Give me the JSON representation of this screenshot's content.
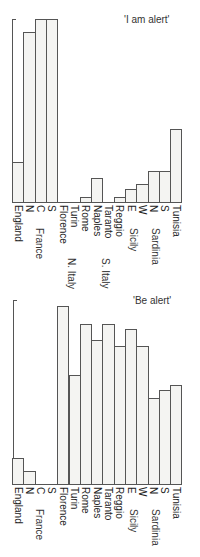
{
  "chart_data": [
    {
      "type": "bar",
      "title": "'I am alert'",
      "xlabel": "",
      "ylabel": "",
      "ylim": [
        0,
        100
      ],
      "grid": false,
      "orientation": "vertical bars, labels rotated 90°",
      "categories": [
        "England",
        "N",
        "C",
        "S",
        "Florence",
        "Turin",
        "Rome",
        "Naples",
        "Taranto",
        "Reggio",
        "E",
        "W",
        "N",
        "S",
        "Tunisia"
      ],
      "groups": [
        {
          "label": "France",
          "members": [
            "N",
            "C",
            "S"
          ]
        },
        {
          "label": "N. Italy",
          "members": [
            "Florence",
            "Turin",
            "Rome"
          ]
        },
        {
          "label": "S. Italy",
          "members": [
            "Naples",
            "Taranto",
            "Reggio"
          ]
        },
        {
          "label": "Sicily",
          "members": [
            "E",
            "W"
          ]
        },
        {
          "label": "Sardinia",
          "members": [
            "N",
            "S"
          ]
        }
      ],
      "values": [
        22,
        93,
        100,
        100,
        0,
        0,
        3,
        13,
        0,
        3,
        7,
        10,
        17,
        17,
        40
      ]
    },
    {
      "type": "bar",
      "title": "'Be alert'",
      "xlabel": "",
      "ylabel": "",
      "ylim": [
        0,
        100
      ],
      "grid": false,
      "orientation": "vertical bars, labels rotated 90°",
      "categories": [
        "England",
        "N",
        "C",
        "S",
        "Florence",
        "Turin",
        "Rome",
        "Naples",
        "Taranto",
        "Reggio",
        "E",
        "W",
        "N",
        "S",
        "Tunisia"
      ],
      "groups": [
        {
          "label": "France",
          "members": [
            "N",
            "C",
            "S"
          ]
        },
        {
          "label": "Sicily",
          "members": [
            "E",
            "W"
          ]
        },
        {
          "label": "Sardinia",
          "members": [
            "N",
            "S"
          ]
        }
      ],
      "values": [
        14,
        7,
        0,
        0,
        97,
        59,
        87,
        78,
        87,
        75,
        84,
        75,
        47,
        51,
        54
      ]
    }
  ],
  "top": {
    "title": "'I am alert'",
    "labels": [
      "England",
      "N",
      "C",
      "S",
      "Florence",
      "Turin",
      "Rome",
      "Naples",
      "Taranto",
      "Reggio",
      "E",
      "W",
      "N",
      "S",
      "Tunisia"
    ],
    "group_france": "France",
    "group_n_italy": "N. Italy",
    "group_s_italy": "S. Italy",
    "group_sicily": "Sicily",
    "group_sardinia": "Sardinia"
  },
  "bottom": {
    "title": "'Be alert'",
    "labels": [
      "England",
      "N",
      "C",
      "S",
      "Florence",
      "Turin",
      "Rome",
      "Naples",
      "Taranto",
      "Reggio",
      "E",
      "W",
      "N",
      "S",
      "Tunisia"
    ],
    "group_france": "France",
    "group_sicily": "Sicily",
    "group_sardinia": "Sardinia"
  }
}
